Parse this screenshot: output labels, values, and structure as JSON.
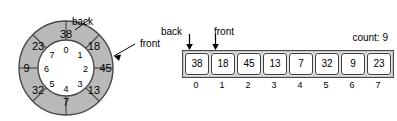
{
  "diagram": {
    "colors": {
      "ring_fill": "#b9b9b9",
      "ring_stroke": "#4a4a4a",
      "array_track": "#c4c4c4",
      "cell_fill": "#ffffff",
      "text": "#000000"
    },
    "ring": {
      "labels": {
        "back": "back",
        "front": "front"
      },
      "slots": [
        {
          "index": "0",
          "value": "38"
        },
        {
          "index": "1",
          "value": "18"
        },
        {
          "index": "2",
          "value": "45"
        },
        {
          "index": "3",
          "value": "13"
        },
        {
          "index": "4",
          "value": "7"
        },
        {
          "index": "5",
          "value": "32"
        },
        {
          "index": "6",
          "value": "9"
        },
        {
          "index": "7",
          "value": "23"
        }
      ]
    },
    "array": {
      "labels": {
        "back": "back",
        "front": "front",
        "count": "count: 9"
      },
      "cells": [
        {
          "index": "0",
          "value": "38"
        },
        {
          "index": "1",
          "value": "18"
        },
        {
          "index": "2",
          "value": "45"
        },
        {
          "index": "3",
          "value": "13"
        },
        {
          "index": "4",
          "value": "7"
        },
        {
          "index": "5",
          "value": "32"
        },
        {
          "index": "6",
          "value": "9"
        },
        {
          "index": "7",
          "value": "23"
        }
      ]
    }
  }
}
